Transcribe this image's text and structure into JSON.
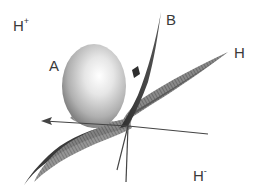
{
  "figure": {
    "labels": {
      "h_plus": {
        "base": "H",
        "sup": "+"
      },
      "h_minus": {
        "base": "H",
        "sup": "-"
      },
      "a": "A",
      "b": "B",
      "h": "H"
    },
    "colors": {
      "sphere_light": "#f4f4f4",
      "sphere_mid": "#c8c8c8",
      "sphere_dark": "#7a7a7a",
      "surface_dark": "#3c3c3c",
      "surface_mesh": "#6e6e6e",
      "axis": "#444444",
      "text": "#3a3a3a"
    }
  }
}
